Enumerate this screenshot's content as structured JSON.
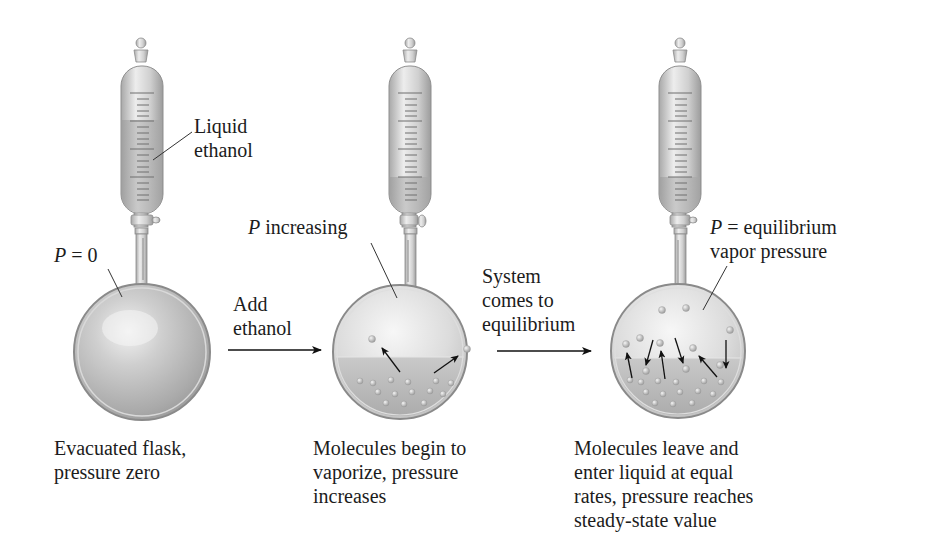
{
  "figure": {
    "stages": [
      {
        "id": "evacuated",
        "pressure_label_var": "P",
        "pressure_label_rest": " = 0",
        "burette_label": "Liquid\nethanol",
        "caption": "Evacuated flask,\npressure zero"
      },
      {
        "id": "vaporizing",
        "pressure_label_var": "P",
        "pressure_label_rest": " increasing",
        "caption": "Molecules begin to\nvaporize, pressure\nincreases"
      },
      {
        "id": "equilibrium",
        "pressure_label_var": "P",
        "pressure_label_rest": " = equilibrium",
        "pressure_label_line2": "vapor pressure",
        "caption": "Molecules leave and\nenter liquid at equal\nrates, pressure reaches\nsteady-state value"
      }
    ],
    "transitions": [
      {
        "label": "Add\nethanol",
        "icon": "arrow-right-icon"
      },
      {
        "label": "System\ncomes to\nequilibrium",
        "icon": "arrow-right-icon"
      }
    ],
    "colors": {
      "glass": "#c8c8c8",
      "glass_dark": "#8e8e8e",
      "liquid": "#b4b4b4",
      "text": "#1c1c1c",
      "arrow": "#111111"
    }
  }
}
